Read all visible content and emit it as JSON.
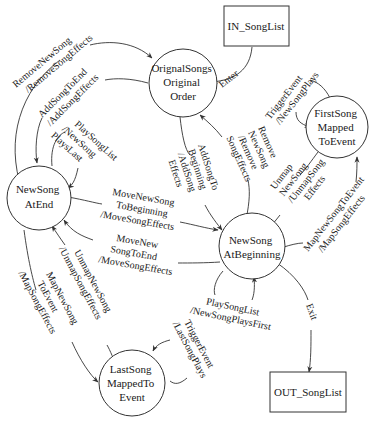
{
  "nodes": {
    "in_songlist": {
      "label": "IN_SongList",
      "shape": "box"
    },
    "out_songlist": {
      "label": "OUT_SongList",
      "shape": "box"
    },
    "original_order": {
      "lines": [
        "OrignalSongs",
        "Original",
        "Order"
      ],
      "shape": "circle"
    },
    "newsong_atend": {
      "lines": [
        "NewSong",
        "AtEnd"
      ],
      "shape": "circle"
    },
    "newsong_atbeginning": {
      "lines": [
        "NewSong",
        "AtBeginning"
      ],
      "shape": "circle"
    },
    "firstsong_mapped": {
      "lines": [
        "FirstSong",
        "Mapped",
        "ToEvent"
      ],
      "shape": "circle"
    },
    "lastsong_mapped": {
      "lines": [
        "LastSong",
        "MappedTo",
        "Event"
      ],
      "shape": "circle"
    }
  },
  "edges": {
    "enter": {
      "from": "IN_SongList",
      "to": "OrignalSongs Original Order",
      "lines": [
        "Enter"
      ]
    },
    "exit": {
      "from": "NewSong AtBeginning",
      "to": "OUT_SongList",
      "lines": [
        "Exit"
      ]
    },
    "remove_new_song_end": {
      "from": "NewSong AtEnd",
      "to": "OrignalSongs Original Order",
      "lines": [
        "RemoveNewSong",
        "/RemoveSongEffects"
      ]
    },
    "add_song_to_end": {
      "from": "OrignalSongs Original Order",
      "to": "NewSong AtEnd",
      "lines": [
        "AddSongToEnd",
        "/AddSongEffects"
      ]
    },
    "play_song_list_last": {
      "from": "NewSong AtEnd",
      "to": "NewSong AtEnd",
      "lines": [
        "PlaySongList",
        "/NewSong",
        "PlaysLast"
      ]
    },
    "add_song_to_beginning": {
      "from": "OrignalSongs Original Order",
      "to": "NewSong AtBeginning",
      "lines": [
        "AddSongTo",
        "Beginning",
        "/AddSong",
        "Effects"
      ]
    },
    "remove_new_song_beginning": {
      "from": "NewSong AtBeginning",
      "to": "OrignalSongs Original Order",
      "lines": [
        "Remove",
        "NewSong",
        "/Remove",
        "SongEffects"
      ]
    },
    "trigger_event_first": {
      "from": "FirstSong MappedToEvent",
      "to": "FirstSong MappedToEvent",
      "lines": [
        "TriggerEvent",
        "/NewSongPlays"
      ]
    },
    "unmap_new_song_first": {
      "from": "FirstSong MappedToEvent",
      "to": "NewSong AtBeginning",
      "lines": [
        "Unmap",
        "NewSong",
        "/UnmapSong",
        "Effects"
      ]
    },
    "map_new_song_first": {
      "from": "NewSong AtBeginning",
      "to": "FirstSong MappedToEvent",
      "lines": [
        "MapNewSongToEvent",
        "/MapSongEffects"
      ]
    },
    "move_to_beginning": {
      "from": "NewSong AtEnd",
      "to": "NewSong AtBeginning",
      "lines": [
        "MoveNewSong",
        "ToBeginning",
        "/MoveSongEffects"
      ]
    },
    "move_to_end": {
      "from": "NewSong AtBeginning",
      "to": "NewSong AtEnd",
      "lines": [
        "MoveNew",
        "SongToEnd",
        "/MoveSongEffects"
      ]
    },
    "play_song_list_first": {
      "from": "NewSong AtBeginning",
      "to": "NewSong AtBeginning",
      "lines": [
        "PlaySongList",
        "/NewSongPlaysFirst"
      ]
    },
    "unmap_new_song_last": {
      "from": "LastSong MappedToEvent",
      "to": "NewSong AtEnd",
      "lines": [
        "UnmapNewSong",
        "/UnmapSongEffects"
      ]
    },
    "map_new_song_last": {
      "from": "NewSong AtEnd",
      "to": "LastSong MappedToEvent",
      "lines": [
        "MapNewSong",
        "ToEvent",
        "/MapSongEffects"
      ]
    },
    "trigger_event_last": {
      "from": "LastSong MappedToEvent",
      "to": "LastSong MappedToEvent",
      "lines": [
        "TriggerEvent",
        "/LastSongPlays"
      ]
    }
  },
  "colors": {
    "stroke": "#333333",
    "text": "#1a1a1a",
    "background": "#ffffff"
  }
}
